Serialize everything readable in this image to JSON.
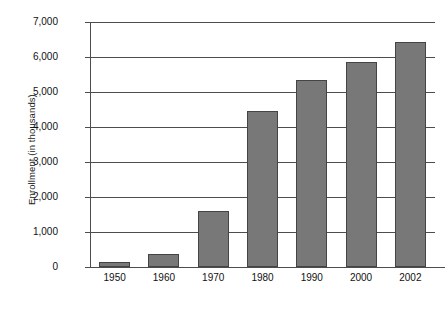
{
  "chart_data": {
    "type": "bar",
    "title": "",
    "subtitle": "",
    "xlabel": "",
    "ylabel": "Enrollment (in thousands)",
    "categories": [
      "1950",
      "1960",
      "1970",
      "1980",
      "1990",
      "2000",
      "2002"
    ],
    "values": [
      140,
      370,
      1600,
      4460,
      5350,
      5860,
      6430
    ],
    "series": [
      {
        "name": "Enrollment",
        "values": [
          140,
          370,
          1600,
          4460,
          5350,
          5860,
          6430
        ]
      }
    ],
    "ylim": [
      0,
      7000
    ],
    "ytick_values": [
      0,
      1000,
      2000,
      3000,
      4000,
      5000,
      6000,
      7000
    ],
    "ytick_labels": [
      "0",
      "1,000",
      "2,000",
      "3,000",
      "4,000",
      "5,000",
      "6,000",
      "7,000"
    ],
    "grid": true,
    "grid_axis": "y",
    "legend": false,
    "legend_position": "none",
    "bar_color": "#787878",
    "bar_border_color": "#444444",
    "axis_color": "#4d4d4d",
    "background_color": "#ffffff"
  }
}
